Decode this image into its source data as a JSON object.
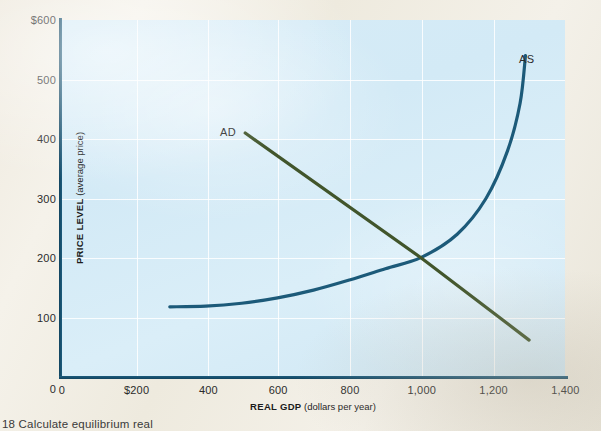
{
  "figure": {
    "caption": "18  Calculate equilibrium real",
    "background_color": "#f3f0e8",
    "plot_background_color": "#d6ebf7"
  },
  "axes": {
    "y_title_bold": "PRICE LEVEL",
    "y_title_rest": " (average price)",
    "x_title_bold": "REAL GDP",
    "x_title_rest": " (dollars per year)",
    "y_ticks": [
      "$600",
      "500",
      "400",
      "300",
      "200",
      "100",
      "0"
    ],
    "y_tick_values": [
      600,
      500,
      400,
      300,
      200,
      100,
      0
    ],
    "x_ticks": [
      "0",
      "$200",
      "400",
      "600",
      "800",
      "1,000",
      "1,200",
      "1,400"
    ],
    "x_tick_values": [
      0,
      200,
      400,
      600,
      800,
      1000,
      1200,
      1400
    ]
  },
  "labels": {
    "ad": "AD",
    "as": "AS"
  },
  "colors": {
    "aggregate_supply": "#1c5a79",
    "aggregate_demand": "#41552b",
    "axis": "#16506e",
    "gridline": "#ffffff"
  },
  "chart_data": {
    "type": "line",
    "title": "",
    "subtitle": "",
    "xlabel": "REAL GDP (dollars per year)",
    "ylabel": "PRICE LEVEL (average price)",
    "xlim": [
      0,
      1400
    ],
    "ylim": [
      0,
      600
    ],
    "grid": true,
    "legend": "inline-annotations",
    "x_tick_labels": [
      "0",
      "$200",
      "400",
      "600",
      "800",
      "1,000",
      "1,200",
      "1,400"
    ],
    "y_tick_labels": [
      "0",
      "100",
      "200",
      "300",
      "400",
      "500",
      "$600"
    ],
    "annotations": [
      {
        "text": "AD",
        "x": 450,
        "y": 430
      },
      {
        "text": "AS",
        "x": 1290,
        "y": 545
      }
    ],
    "equilibrium": {
      "real_gdp": 1000,
      "price_level": 200
    },
    "series": [
      {
        "name": "AS",
        "label": "Aggregate Supply",
        "color": "#1c5a79",
        "shape": "upward-sloping-convex",
        "points": [
          {
            "x": 300,
            "y": 118
          },
          {
            "x": 400,
            "y": 119
          },
          {
            "x": 500,
            "y": 124
          },
          {
            "x": 600,
            "y": 133
          },
          {
            "x": 700,
            "y": 146
          },
          {
            "x": 800,
            "y": 163
          },
          {
            "x": 900,
            "y": 182
          },
          {
            "x": 1000,
            "y": 201
          },
          {
            "x": 1100,
            "y": 240
          },
          {
            "x": 1180,
            "y": 300
          },
          {
            "x": 1240,
            "y": 380
          },
          {
            "x": 1275,
            "y": 460
          },
          {
            "x": 1290,
            "y": 540
          }
        ]
      },
      {
        "name": "AD",
        "label": "Aggregate Demand",
        "color": "#41552b",
        "shape": "downward-sloping-linear",
        "points": [
          {
            "x": 510,
            "y": 410
          },
          {
            "x": 1000,
            "y": 200
          },
          {
            "x": 1300,
            "y": 62
          }
        ]
      }
    ]
  }
}
